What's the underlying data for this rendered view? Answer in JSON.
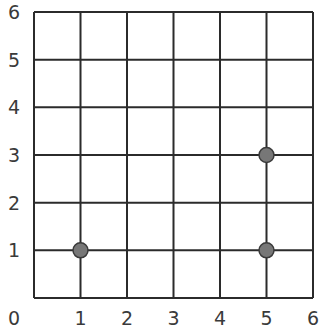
{
  "chart_data": {
    "type": "scatter",
    "title": "",
    "xlabel": "",
    "ylabel": "",
    "xlim": [
      0,
      6
    ],
    "ylim": [
      0,
      6
    ],
    "grid": true,
    "x_ticks": [
      "0",
      "1",
      "2",
      "3",
      "4",
      "5",
      "6"
    ],
    "y_ticks": [
      "1",
      "2",
      "3",
      "4",
      "5",
      "6"
    ],
    "series": [
      {
        "name": "points",
        "points": [
          {
            "x": 1,
            "y": 1
          },
          {
            "x": 5,
            "y": 1
          },
          {
            "x": 5,
            "y": 3
          }
        ]
      }
    ],
    "colors": {
      "point_fill": "#777777",
      "point_stroke": "#3a3a3a",
      "grid": "#2b2b2b",
      "label": "#3a3a3a"
    }
  }
}
